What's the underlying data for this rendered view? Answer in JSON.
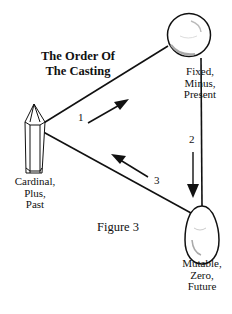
{
  "title": {
    "line1": "The Order Of",
    "line2": "The Casting"
  },
  "figure_caption": "Figure 3",
  "nodes": [
    {
      "id": "crystal",
      "shape": "crystal",
      "label_lines": [
        "Cardinal,",
        "Plus,",
        "Past"
      ]
    },
    {
      "id": "sphere",
      "shape": "sphere",
      "label_lines": [
        "Fixed,",
        "Minus,",
        "Present"
      ]
    },
    {
      "id": "egg",
      "shape": "egg",
      "label_lines": [
        "Mutable,",
        "Zero,",
        "Future"
      ]
    }
  ],
  "edges": [
    {
      "from": "crystal",
      "to": "sphere",
      "step": "1"
    },
    {
      "from": "sphere",
      "to": "egg",
      "step": "2"
    },
    {
      "from": "egg",
      "to": "crystal",
      "step": "3"
    }
  ],
  "colors": {
    "line": "#111111",
    "highlight": "#b0b0b0"
  }
}
